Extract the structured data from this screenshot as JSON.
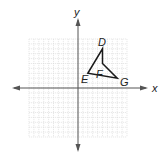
{
  "figure": {
    "axes": {
      "x_label": "x",
      "y_label": "y",
      "x_range": [
        -10,
        10
      ],
      "y_range": [
        -10,
        10
      ],
      "grid": true
    },
    "polygon": {
      "name": "DEFG",
      "vertices": [
        {
          "label": "D",
          "x": 5,
          "y": 8
        },
        {
          "label": "F",
          "x": 5,
          "y": 5
        },
        {
          "label": "G",
          "x": 8,
          "y": 2
        },
        {
          "label": "E",
          "x": 2,
          "y": 3
        }
      ],
      "stroke_color": "#1a1a1a"
    },
    "colors": {
      "grid": "#d9d9d9",
      "axis": "#555555"
    }
  }
}
